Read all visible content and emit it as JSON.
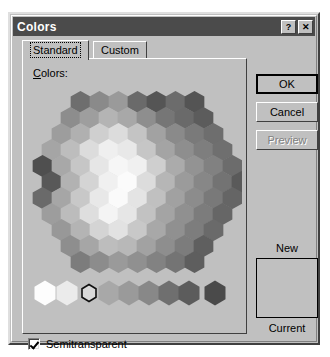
{
  "window": {
    "title": "Colors",
    "help_button": "?",
    "close_button": "✕"
  },
  "tabs": [
    {
      "label": "Standard",
      "active": true
    },
    {
      "label": "Custom",
      "active": false
    }
  ],
  "panel": {
    "colors_label_accel": "C",
    "colors_label_rest": "olors:"
  },
  "buttons": {
    "ok": "OK",
    "cancel": "Cancel",
    "preview": "Preview"
  },
  "preview": {
    "new_label": "New",
    "current_label": "Current",
    "swatch_color": "#c0c0c0"
  },
  "options": {
    "semitransparent_label": "Semitransparent",
    "semitransparent_checked": true
  },
  "palette": {
    "selected_index": 2,
    "hex_width": 19,
    "hex_height": 22,
    "rows": [
      {
        "y": 10,
        "x": 44,
        "colors": [
          "#6e6e6e",
          "#8a8a8a",
          "#9a9a9a",
          "#6a6a6a",
          "#555555",
          "#6c6c6c",
          "#545454"
        ]
      },
      {
        "y": 26,
        "x": 34,
        "colors": [
          "#8d8d8d",
          "#9e9e9e",
          "#b4b4b4",
          "#a8a8a8",
          "#8e8e8e",
          "#767676",
          "#6a6a6a",
          "#5c5c5c"
        ]
      },
      {
        "y": 42,
        "x": 25,
        "colors": [
          "#9d9d9d",
          "#b0b0b0",
          "#cfcfcf",
          "#dcdcdc",
          "#c4c4c4",
          "#a2a2a2",
          "#8a8a8a",
          "#7a7a7a",
          "#6e6e6e"
        ]
      },
      {
        "y": 58,
        "x": 15,
        "colors": [
          "#a5a5a5",
          "#bdbdbd",
          "#dcdcdc",
          "#efefef",
          "#e8e8e8",
          "#c6c6c6",
          "#a4a4a4",
          "#8e8e8e",
          "#7e7e7e",
          "#6f6f6f"
        ]
      },
      {
        "y": 74,
        "x": 6,
        "colors": [
          "#4f4f4f",
          "#a8a8a8",
          "#c6c6c6",
          "#e6e6e6",
          "#f6f6f6",
          "#f0f0f0",
          "#cfcfcf",
          "#ababab",
          "#939393",
          "#818181",
          "#6c6c6c"
        ]
      },
      {
        "y": 90,
        "x": 15,
        "colors": [
          "#585858",
          "#b2b2b2",
          "#d4d4d4",
          "#f0f0f0",
          "#fbfbfb",
          "#dcdcdc",
          "#b6b6b6",
          "#9b9b9b",
          "#878787",
          "#737373",
          "#5a5a5a"
        ]
      },
      {
        "y": 106,
        "x": 6,
        "colors": [
          "#6a6a6a",
          "#a6a6a6",
          "#c8c8c8",
          "#e8e8e8",
          "#fafafa",
          "#e4e4e4",
          "#c0c0c0",
          "#a1a1a1",
          "#8c8c8c",
          "#797979",
          "#656565"
        ]
      },
      {
        "y": 122,
        "x": 15,
        "colors": [
          "#9d9d9d",
          "#bcbcbc",
          "#dedede",
          "#f4f4f4",
          "#e6e6e6",
          "#c2c2c2",
          "#a4a4a4",
          "#909090",
          "#7c7c7c",
          "#666666"
        ]
      },
      {
        "y": 138,
        "x": 25,
        "colors": [
          "#989898",
          "#b4b4b4",
          "#d4d4d4",
          "#e2e2e2",
          "#c8c8c8",
          "#a8a8a8",
          "#909090",
          "#7d7d7d",
          "#6a6a6a"
        ]
      },
      {
        "y": 154,
        "x": 34,
        "colors": [
          "#8e8e8e",
          "#a6a6a6",
          "#bdbdbd",
          "#b8b8b8",
          "#a2a2a2",
          "#8e8e8e",
          "#7c7c7c",
          "#5f5f5f"
        ]
      },
      {
        "y": 170,
        "x": 44,
        "colors": [
          "#7c7c7c",
          "#8c8c8c",
          "#9a9a9a",
          "#909090",
          "#828282",
          "#747474",
          "#5e5e5e"
        ]
      }
    ],
    "bottom_row": {
      "y": 200,
      "items": [
        {
          "x": 8,
          "color": "#fdfdfd",
          "size": "large"
        },
        {
          "x": 30,
          "color": "#ebebeb",
          "size": "large"
        },
        {
          "x": 52,
          "color": "#d9d9d9",
          "size": "small",
          "selected": true
        },
        {
          "x": 72,
          "color": "#a8a8a8",
          "size": "large"
        },
        {
          "x": 92,
          "color": "#9a9a9a",
          "size": "large"
        },
        {
          "x": 112,
          "color": "#888888",
          "size": "large"
        },
        {
          "x": 132,
          "color": "#6f6f6f",
          "size": "large"
        },
        {
          "x": 152,
          "color": "#5c5c5c",
          "size": "large"
        },
        {
          "x": 178,
          "color": "#4a4a4a",
          "size": "large"
        }
      ]
    }
  }
}
